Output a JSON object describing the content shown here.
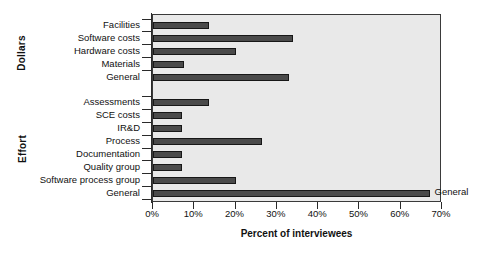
{
  "chart_data": {
    "type": "bar",
    "orientation": "horizontal",
    "title": "",
    "xlabel": "Percent of interviewees",
    "ylabel": "",
    "xlim": [
      0,
      70
    ],
    "xticks": [
      "0%",
      "10%",
      "20%",
      "30%",
      "40%",
      "50%",
      "60%",
      "70%"
    ],
    "xtick_values": [
      0,
      10,
      20,
      30,
      40,
      50,
      60,
      70
    ],
    "grid": false,
    "legend": "none",
    "bar_color": "#4a4a4a",
    "plot_background": "#e9e9e9",
    "axis_color": "#2a2a2a",
    "group_labels": [
      "Dollars",
      "Effort"
    ],
    "groups": [
      {
        "name": "Dollars",
        "categories": [
          "Facilities",
          "Software costs",
          "Hardware costs",
          "Materials",
          "General"
        ],
        "values": [
          13.5,
          34,
          20,
          7.5,
          33
        ]
      },
      {
        "name": "Effort",
        "categories": [
          "Assessments",
          "SCE costs",
          "IR&D",
          "Process",
          "Documentation",
          "Quality group",
          "Software process group",
          "General"
        ],
        "values": [
          13.5,
          7,
          7,
          26.5,
          7,
          7,
          20,
          67
        ]
      }
    ],
    "categories": [
      "Facilities",
      "Software costs",
      "Hardware costs",
      "Materials",
      "General",
      "Assessments",
      "SCE costs",
      "IR&D",
      "Process",
      "Documentation",
      "Quality group",
      "Software process group",
      "General"
    ],
    "values": [
      13.5,
      34,
      20,
      7.5,
      33,
      13.5,
      7,
      7,
      26.5,
      7,
      7,
      20,
      67
    ],
    "annotations": [
      {
        "text": "General",
        "category": "General",
        "group": "Effort",
        "value": 67
      }
    ]
  }
}
